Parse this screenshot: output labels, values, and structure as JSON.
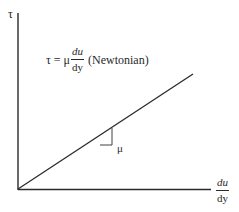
{
  "diagram": {
    "type": "shear-stress-vs-shear-rate",
    "y_axis": {
      "label": "τ"
    },
    "x_axis": {
      "label_numerator": "du",
      "label_denominator": "dy"
    },
    "equation": {
      "lhs": "τ = μ",
      "numerator": "du",
      "denominator": "dy",
      "note": "(Newtonian)"
    },
    "slope_label": "μ",
    "colors": {
      "line": "#2a2a2a",
      "axis": "#2a2a2a"
    }
  }
}
